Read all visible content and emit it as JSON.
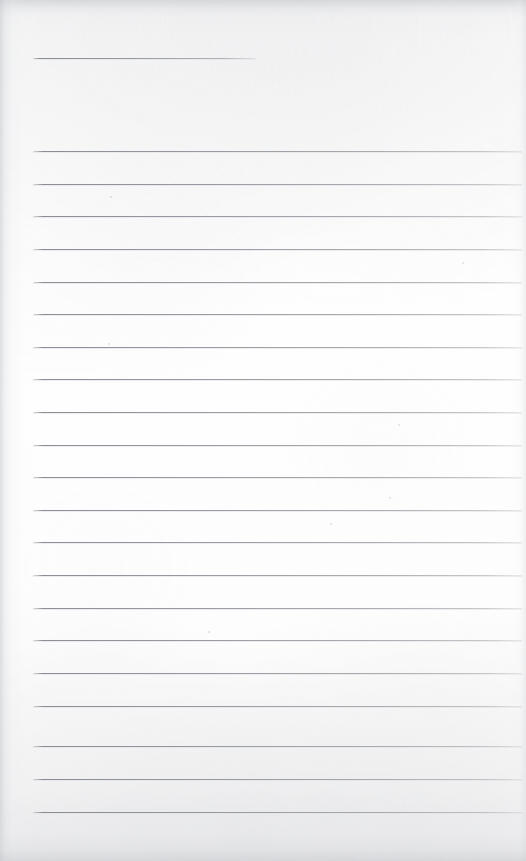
{
  "document": {
    "kind": "scanned-lined-paper",
    "title_line_present": true,
    "alt_text": "Blank scanned lined notebook page",
    "paper_color": "#fdfdfd",
    "rule_color": "#80838b",
    "edge_shadow_color": "#c4c6ca",
    "page_width": 526,
    "page_height": 861
  },
  "header_rule": {
    "x": 33,
    "y": 58,
    "width": 223
  },
  "body_rules": {
    "left": 33,
    "right": 522,
    "width": 489,
    "spacing": 32.6,
    "count": 21,
    "y_positions": [
      151,
      184,
      216,
      249,
      282,
      314,
      347,
      379,
      412,
      445,
      477,
      510,
      542,
      575,
      608,
      640,
      673,
      706,
      746,
      779,
      812
    ]
  },
  "specks": [
    {
      "x": 398,
      "y": 424,
      "size": 2
    },
    {
      "x": 389,
      "y": 497,
      "size": 2
    },
    {
      "x": 110,
      "y": 196,
      "size": 2
    },
    {
      "x": 108,
      "y": 343,
      "size": 2
    },
    {
      "x": 330,
      "y": 523,
      "size": 2
    },
    {
      "x": 208,
      "y": 631,
      "size": 2
    },
    {
      "x": 462,
      "y": 262,
      "size": 2
    }
  ]
}
